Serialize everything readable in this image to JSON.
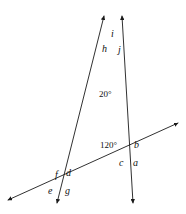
{
  "figure": {
    "kind": "geometry-diagram",
    "background_color": "#ffffff",
    "stroke_color": "#1a1a1a",
    "text_color": "#111111",
    "width": 186,
    "height": 214
  },
  "angle_labels": [
    {
      "id": "a",
      "text": "a",
      "x": 133,
      "y": 158,
      "kind": "letter"
    },
    {
      "id": "b",
      "text": "b",
      "x": 134,
      "y": 140,
      "kind": "letter"
    },
    {
      "id": "c",
      "text": "c",
      "x": 119,
      "y": 158,
      "kind": "letter"
    },
    {
      "id": "d",
      "text": "d",
      "x": 66,
      "y": 168,
      "kind": "letter"
    },
    {
      "id": "e",
      "text": "e",
      "x": 48,
      "y": 186,
      "kind": "letter"
    },
    {
      "id": "f",
      "text": "f",
      "x": 55,
      "y": 170,
      "kind": "letter"
    },
    {
      "id": "g",
      "text": "g",
      "x": 65,
      "y": 186,
      "kind": "letter"
    },
    {
      "id": "h",
      "text": "h",
      "x": 102,
      "y": 44,
      "kind": "letter"
    },
    {
      "id": "i",
      "text": "i",
      "x": 111,
      "y": 29,
      "kind": "letter"
    },
    {
      "id": "j",
      "text": "j",
      "x": 118,
      "y": 45,
      "kind": "letter"
    },
    {
      "id": "angle-20",
      "text": "20°",
      "x": 99,
      "y": 90,
      "kind": "degree"
    },
    {
      "id": "angle-120",
      "text": "120°",
      "x": 100,
      "y": 141,
      "kind": "degree"
    }
  ],
  "vertices": {
    "top": {
      "x": 114,
      "y": 47
    },
    "right": {
      "x": 128,
      "y": 151
    },
    "lower_left": {
      "x": 62,
      "y": 180
    }
  },
  "lines": [
    {
      "id": "line-left-ray",
      "name": "ray-through-top-and-lower-left",
      "from": {
        "x": 104,
        "y": 16
      },
      "to": {
        "x": 57,
        "y": 203
      },
      "arrow_start": true,
      "arrow_end": true
    },
    {
      "id": "line-right-ray",
      "name": "ray-through-top-and-right",
      "from": {
        "x": 122,
        "y": 16
      },
      "to": {
        "x": 133,
        "y": 203
      },
      "arrow_start": true,
      "arrow_end": true
    },
    {
      "id": "line-transversal",
      "name": "transversal-line",
      "from": {
        "x": 8,
        "y": 200
      },
      "to": {
        "x": 178,
        "y": 123
      },
      "arrow_start": true,
      "arrow_end": true
    }
  ]
}
